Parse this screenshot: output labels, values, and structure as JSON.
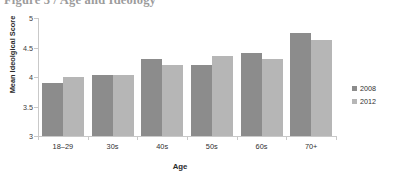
{
  "figure": {
    "caption": "Figure 3 / Age and Ideology"
  },
  "legend": {
    "entries": [
      {
        "label": "2008",
        "color": "#8c8c8c"
      },
      {
        "label": "2012",
        "color": "#b6b6b6"
      }
    ]
  },
  "axes": {
    "y_title": "Mean Ideolgical Score",
    "x_title": "Age",
    "y_ticks": [
      "5",
      "4.5",
      "4",
      "3.5",
      "3"
    ]
  },
  "chart_data": {
    "type": "bar",
    "title": "Figure 3 / Age and Ideology",
    "xlabel": "Age",
    "ylabel": "Mean Ideolgical Score",
    "categories": [
      "18–29",
      "30s",
      "40s",
      "50s",
      "60s",
      "70+"
    ],
    "series": [
      {
        "name": "2008",
        "color": "#8c8c8c",
        "values": [
          3.9,
          4.04,
          4.3,
          4.21,
          4.4,
          4.75
        ]
      },
      {
        "name": "2012",
        "color": "#b6b6b6",
        "values": [
          4.0,
          4.04,
          4.21,
          4.35,
          4.31,
          4.63
        ]
      }
    ],
    "ylim": [
      3,
      5
    ],
    "ytick_values": [
      5,
      4.5,
      4,
      3.5,
      3
    ],
    "grid": false,
    "legend_position": "right"
  }
}
